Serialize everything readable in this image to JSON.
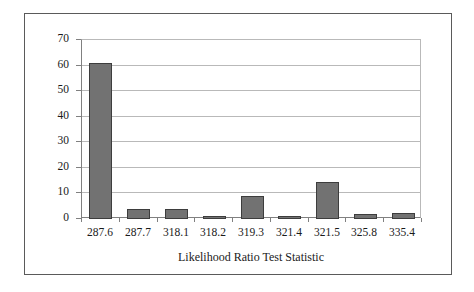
{
  "chart_data": {
    "type": "bar",
    "title": "",
    "subtitle": "",
    "xlabel": "Likelihood Ratio Test Statistic",
    "ylabel": "",
    "categories": [
      "287.6",
      "287.7",
      "318.1",
      "318.2",
      "319.3",
      "321.4",
      "321.5",
      "325.8",
      "335.4"
    ],
    "values": [
      61,
      4,
      4,
      1,
      9,
      1,
      14.5,
      2,
      2.5
    ],
    "ylim": [
      0,
      70
    ],
    "ytick_labels": [
      "0",
      "10",
      "20",
      "30",
      "40",
      "50",
      "60",
      "70"
    ],
    "ytick_values": [
      0,
      10,
      20,
      30,
      40,
      50,
      60,
      70
    ],
    "grid": "horizontal",
    "legend": "none",
    "series": [
      {
        "name": "frequency",
        "values": [
          61,
          4,
          4,
          1,
          9,
          1,
          14.5,
          2,
          2.5
        ]
      }
    ],
    "colors": {
      "bar_fill": "#727272",
      "bar_border": "#3d3d3d",
      "gridline": "#b9b9b9",
      "axis": "#808080",
      "frame": "#5a5a5a",
      "plot_background": "#ffffff",
      "text": "#1a1a1a"
    }
  }
}
